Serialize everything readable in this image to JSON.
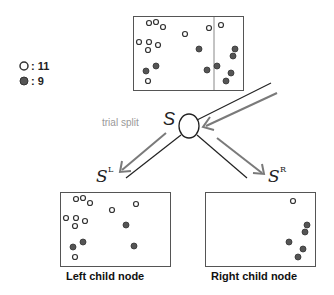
{
  "legend": {
    "items": [
      {
        "type": "hollow",
        "label": ": 11",
        "count": 11
      },
      {
        "type": "filled",
        "label": ": 9",
        "count": 9
      }
    ]
  },
  "colors": {
    "box_border": "#555555",
    "hollow_fill": "#ffffff",
    "hollow_stroke": "#333333",
    "filled_fill": "#555555",
    "arrow_gray": "#7a7a7a",
    "line_black": "#222222",
    "trial_split_text": "#999999"
  },
  "diagram": {
    "parent_label": "S",
    "trial_split_label": "trial split",
    "left_set_label": "S",
    "left_set_sup": "L",
    "right_set_label": "S",
    "right_set_sup": "R",
    "left_node_caption": "Left child node",
    "right_node_caption": "Right child node"
  },
  "parent_points": {
    "hollow": [
      [
        149,
        23
      ],
      [
        156,
        22
      ],
      [
        163,
        27
      ],
      [
        185,
        34
      ],
      [
        209,
        28
      ],
      [
        221,
        25
      ],
      [
        139,
        42
      ],
      [
        149,
        42
      ],
      [
        158,
        45
      ],
      [
        148,
        50
      ],
      [
        148,
        81
      ]
    ],
    "filled": [
      [
        199,
        49
      ],
      [
        235,
        49
      ],
      [
        233,
        56
      ],
      [
        156,
        66
      ],
      [
        146,
        71
      ],
      [
        207,
        70
      ],
      [
        217,
        66
      ],
      [
        231,
        73
      ],
      [
        226,
        81
      ]
    ]
  }
}
